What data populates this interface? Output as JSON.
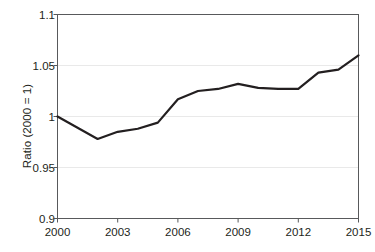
{
  "chart_data": {
    "type": "line",
    "title": "",
    "subtitle": "",
    "xlabel": "",
    "ylabel": "Ratio (2000 = 1)",
    "x": [
      2000,
      2001,
      2002,
      2003,
      2004,
      2005,
      2006,
      2007,
      2008,
      2009,
      2010,
      2011,
      2012,
      2013,
      2014,
      2015
    ],
    "values": [
      1.0,
      0.989,
      0.978,
      0.985,
      0.988,
      0.994,
      1.017,
      1.025,
      1.027,
      1.032,
      1.028,
      1.027,
      1.027,
      1.043,
      1.046,
      1.06
    ],
    "series": [
      {
        "name": "Ratio",
        "values": [
          1.0,
          0.989,
          0.978,
          0.985,
          0.988,
          0.994,
          1.017,
          1.025,
          1.027,
          1.032,
          1.028,
          1.027,
          1.027,
          1.043,
          1.046,
          1.06
        ],
        "color": "#231f20"
      }
    ],
    "xlim": [
      2000,
      2015
    ],
    "ylim": [
      0.9,
      1.1
    ],
    "x_ticks": [
      2000,
      2003,
      2006,
      2009,
      2012,
      2015
    ],
    "x_tick_labels": [
      "2000",
      "2003",
      "2006",
      "2009",
      "2012",
      "2015"
    ],
    "y_ticks": [
      0.9,
      0.95,
      1.0,
      1.05,
      1.1
    ],
    "y_tick_labels": [
      "0.9",
      "0.95",
      "1",
      "1.05",
      "1.1"
    ],
    "grid": "horizontal",
    "grid_color": "#e9e9e9",
    "axis_color": "#58595b",
    "legend": "none",
    "legend_position": "none",
    "annotations": [],
    "background_color": "#ffffff"
  }
}
